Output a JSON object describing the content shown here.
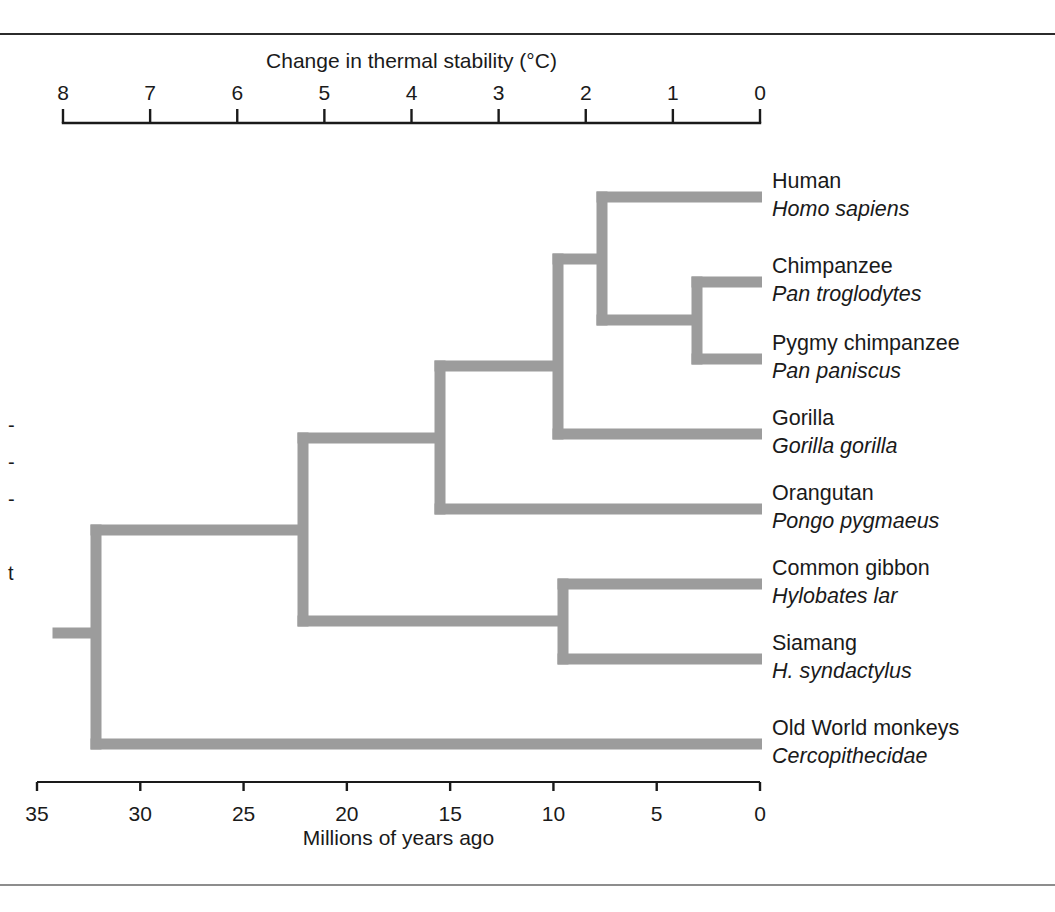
{
  "figure": {
    "background": "#ffffff",
    "branch_color": "#9c9c9c",
    "axis_color": "#1a1a1a",
    "rule_top_color": "#2b2b2b",
    "rule_bottom_color": "#8d8d8d"
  },
  "chart_data": {
    "type": "diagram",
    "subtype": "phylogenetic-tree-cladogram",
    "title": "",
    "top_axis": {
      "label": "Change in thermal stability (°C)",
      "ticks": [
        8,
        7,
        6,
        5,
        4,
        3,
        2,
        1,
        0
      ],
      "tick_labels": [
        "8",
        "7",
        "6",
        "5",
        "4",
        "3",
        "2",
        "1",
        "0"
      ],
      "range": [
        8,
        0
      ],
      "direction": "decreasing-left-to-right",
      "px_left": 63,
      "px_right": 760,
      "axis_y": 123,
      "tick_len": 14,
      "label_y": 68
    },
    "bottom_axis": {
      "label": "Millions of years ago",
      "ticks": [
        35,
        30,
        25,
        20,
        15,
        10,
        5,
        0
      ],
      "tick_labels": [
        "35",
        "30",
        "25",
        "20",
        "15",
        "10",
        "5",
        "0"
      ],
      "range": [
        35,
        0
      ],
      "direction": "decreasing-left-to-right",
      "px_left": 37,
      "px_right": 760,
      "axis_y": 782,
      "tick_len": 9,
      "label_y": 813,
      "title_y": 845
    },
    "branch_stroke_width": 11,
    "tips": [
      {
        "id": "human",
        "common": "Human",
        "latin": "Homo sapiens",
        "y": 197,
        "tip_x": 762,
        "parent_x": 602
      },
      {
        "id": "chimp",
        "common": "Chimpanzee",
        "latin": "Pan troglodytes",
        "y": 282,
        "tip_x": 762,
        "parent_x": 697
      },
      {
        "id": "bonobo",
        "common": "Pygmy chimpanzee",
        "latin": "Pan paniscus",
        "y": 359,
        "tip_x": 762,
        "parent_x": 697
      },
      {
        "id": "gorilla",
        "common": "Gorilla",
        "latin": "Gorilla gorilla",
        "y": 434,
        "tip_x": 762,
        "parent_x": 558
      },
      {
        "id": "orangutan",
        "common": "Orangutan",
        "latin": "Pongo pygmaeus",
        "y": 509,
        "tip_x": 762,
        "parent_x": 440
      },
      {
        "id": "gibbon",
        "common": "Common gibbon",
        "latin": "Hylobates lar",
        "y": 584,
        "tip_x": 762,
        "parent_x": 563
      },
      {
        "id": "siamang",
        "common": "Siamang",
        "latin": "H. syndactylus",
        "y": 659,
        "tip_x": 762,
        "parent_x": 563
      },
      {
        "id": "owmonkey",
        "common": "Old World monkeys",
        "latin": "Cercopithecidae",
        "y": 744,
        "tip_x": 762,
        "parent_x": 96
      }
    ],
    "nodes": [
      {
        "id": "pan",
        "x": 697,
        "y_top": 282,
        "y_bottom": 359,
        "parent_x": 602,
        "y": 320,
        "mya": 3.0
      },
      {
        "id": "homininae",
        "x": 602,
        "y_top": 197,
        "y_bottom": 320,
        "parent_x": 558,
        "y": 259,
        "mya": 7.7
      },
      {
        "id": "african",
        "x": 558,
        "y_top": 259,
        "y_bottom": 434,
        "parent_x": 440,
        "y": 366,
        "mya": 9.8
      },
      {
        "id": "greatape",
        "x": 440,
        "y_top": 366,
        "y_bottom": 509,
        "parent_x": 303,
        "y": 438,
        "mya": 15.9
      },
      {
        "id": "hylobates",
        "x": 563,
        "y_top": 584,
        "y_bottom": 659,
        "parent_x": 303,
        "y": 621,
        "mya": 9.7
      },
      {
        "id": "hominoidea",
        "x": 303,
        "y_top": 438,
        "y_bottom": 621,
        "parent_x": 96,
        "y": 530,
        "mya": 22.8
      },
      {
        "id": "root",
        "x": 96,
        "y_top": 530,
        "y_bottom": 744,
        "parent_x": 58,
        "y": 633,
        "mya": 33.0
      }
    ],
    "root_stub": {
      "x_start": 58,
      "x_end": 96,
      "y": 633
    },
    "tip_label_x": 772,
    "tip_label_common_dy": -9,
    "tip_label_latin_dy": 19
  },
  "margin_note": {
    "lines": [
      "-",
      "-",
      "-",
      "",
      "t"
    ]
  }
}
